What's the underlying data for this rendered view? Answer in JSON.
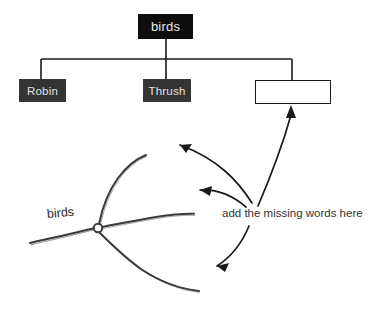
{
  "canvas": {
    "width": 388,
    "height": 336,
    "background": "#ffffff"
  },
  "taxonomy_tree": {
    "root": {
      "label": "birds",
      "fill": "#0d0d0d",
      "text_color": "#e8e8e8"
    },
    "children": [
      {
        "label": "Robin",
        "fill": "#343434",
        "text_color": "#e2e2e2",
        "filled": true
      },
      {
        "label": "Thrush",
        "fill": "#343434",
        "text_color": "#e2e2e2",
        "filled": true
      },
      {
        "label": "",
        "fill": "#ffffff",
        "text_color": "#1a1a1a",
        "filled": false
      }
    ],
    "connector_color": "#1a1a1a"
  },
  "cladogram": {
    "root_label": "birds",
    "ink_color": "#3a3a3a",
    "branch_count": 3,
    "node_marker": "open-circle"
  },
  "annotation": {
    "caption": "add the missing words here",
    "arrow_count": 3,
    "arrow_color": "#1a1a1a",
    "arrow_targets": [
      "upper-branch-tip",
      "middle-branch-tip",
      "lower-branch-tip",
      "empty-box"
    ]
  }
}
